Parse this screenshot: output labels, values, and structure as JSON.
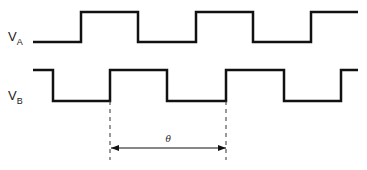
{
  "diagram": {
    "signals": [
      {
        "name": "V",
        "subscript": "A",
        "label_pos": [
          8,
          29
        ],
        "start_level": "low",
        "edges_x": [
          81,
          138,
          196,
          253,
          311
        ],
        "x_start": 33,
        "x_end": 358,
        "high_y": 12,
        "low_y": 42
      },
      {
        "name": "V",
        "subscript": "B",
        "label_pos": [
          8,
          88
        ],
        "start_level": "high",
        "edges_x": [
          53,
          110,
          167,
          226,
          284,
          341
        ],
        "x_start": 33,
        "x_end": 358,
        "high_y": 70,
        "low_y": 101
      }
    ],
    "markers": {
      "dashed_x": [
        110,
        226
      ],
      "y_from": 101,
      "y_to": 160
    },
    "dimension": {
      "label": "θ",
      "x1": 111,
      "x2": 226,
      "y": 148
    },
    "stroke_color": "#111111"
  }
}
